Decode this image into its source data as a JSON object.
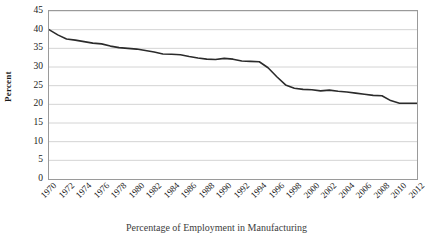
{
  "figure": {
    "caption": "Percentage of Employment in Manufacturing"
  },
  "axes": {
    "ylabel": "Percent",
    "yticks": [
      "0",
      "5",
      "10",
      "15",
      "20",
      "25",
      "30",
      "35",
      "40",
      "45"
    ],
    "xticks": [
      "1970",
      "1972",
      "1974",
      "1976",
      "1978",
      "1980",
      "1982",
      "1984",
      "1986",
      "1988",
      "1990",
      "1992",
      "1994",
      "1996",
      "1998",
      "2000",
      "2002",
      "2004",
      "2006",
      "2008",
      "2010",
      "2012"
    ]
  },
  "style": {
    "line_color": "#2b2b2b",
    "grid_color": "#d4d4d4",
    "frame_color": "#9a9a9a",
    "background": "#ffffff",
    "text_color": "#1a1a1a"
  },
  "chart_data": {
    "type": "line",
    "title": "",
    "xlabel": "",
    "ylabel": "Percent",
    "xlim": [
      1970,
      2012
    ],
    "ylim": [
      0,
      45
    ],
    "ytick_step": 5,
    "xtick_step": 2,
    "grid": "horizontal",
    "legend": "none",
    "x": [
      1970,
      1971,
      1972,
      1973,
      1974,
      1975,
      1976,
      1977,
      1978,
      1979,
      1980,
      1981,
      1982,
      1983,
      1984,
      1985,
      1986,
      1987,
      1988,
      1989,
      1990,
      1991,
      1992,
      1993,
      1994,
      1995,
      1996,
      1997,
      1998,
      1999,
      2000,
      2001,
      2002,
      2003,
      2004,
      2005,
      2006,
      2007,
      2008,
      2009,
      2010,
      2011,
      2012
    ],
    "series": [
      {
        "name": "Percent",
        "values": [
          40.0,
          38.6,
          37.5,
          37.2,
          36.8,
          36.4,
          36.2,
          35.6,
          35.2,
          35.0,
          34.8,
          34.4,
          34.0,
          33.5,
          33.4,
          33.3,
          32.8,
          32.4,
          32.1,
          32.0,
          32.3,
          32.1,
          31.6,
          31.5,
          31.4,
          29.8,
          27.4,
          25.2,
          24.3,
          24.0,
          23.9,
          23.6,
          23.8,
          23.5,
          23.3,
          23.0,
          22.7,
          22.4,
          22.3,
          21.0,
          20.3,
          20.3,
          20.3
        ]
      }
    ]
  }
}
